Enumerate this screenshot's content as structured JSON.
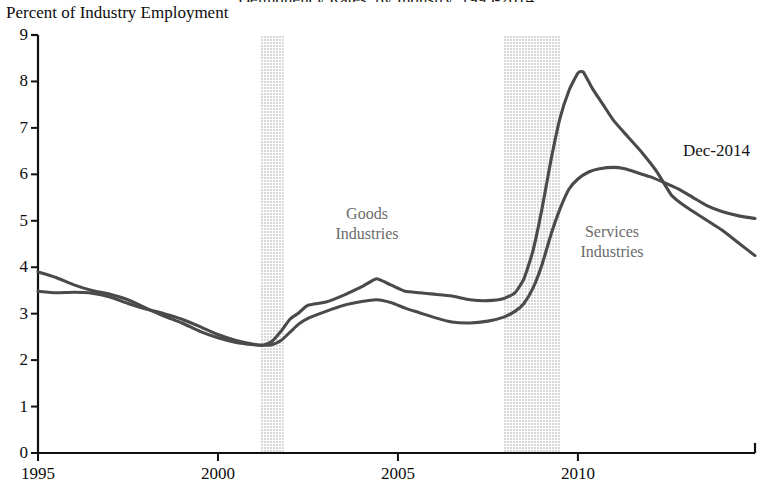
{
  "header": {
    "cut_off_title": "Delinquency Rates, by Industry, 1995-2014",
    "y_axis_caption": "Percent of Industry Employment"
  },
  "annotations": {
    "goods_label_line1": "Goods",
    "goods_label_line2": "Industries",
    "services_label_line1": "Services",
    "services_label_line2": "Industries",
    "end_point_label": "Dec-2014"
  },
  "colors": {
    "line": "#4a4a4a",
    "recession_band": "#d7d7d7",
    "axis": "#111111",
    "series_label": "#6b6b6b",
    "tick_text": "#0d0d0d"
  },
  "chart_data": {
    "type": "line",
    "title": "Delinquency Rates, by Industry, 1995-2014",
    "xlabel": "",
    "ylabel": "Percent of Industry Employment",
    "xlim": [
      1995,
      2014.92
    ],
    "ylim": [
      0,
      9
    ],
    "xticks": [
      1995,
      2000,
      2005,
      2010
    ],
    "xtick_labels": [
      "1995",
      "2000",
      "2005",
      "2010"
    ],
    "yticks": [
      0,
      1,
      2,
      3,
      4,
      5,
      6,
      7,
      8,
      9
    ],
    "ytick_labels": [
      "0",
      "1",
      "2",
      "3",
      "4",
      "5",
      "6",
      "7",
      "8",
      "9"
    ],
    "grid": false,
    "legend_position": "inline-annotations",
    "shaded_regions": [
      {
        "name": "recession-2001",
        "x_start": 2001.17,
        "x_end": 2001.83,
        "color": "#d7d7d7"
      },
      {
        "name": "recession-2008",
        "x_start": 2007.92,
        "x_end": 2009.5,
        "color": "#d7d7d7"
      }
    ],
    "series": [
      {
        "name": "Goods Industries",
        "color": "#4a4a4a",
        "x": [
          1995.0,
          1995.5,
          1996.0,
          1996.5,
          1997.0,
          1997.5,
          1998.0,
          1998.5,
          1999.0,
          1999.5,
          2000.0,
          2000.5,
          2001.0,
          2001.25,
          2001.5,
          2001.75,
          2002.0,
          2002.25,
          2002.5,
          2003.0,
          2003.5,
          2004.0,
          2004.4,
          2004.8,
          2005.2,
          2005.6,
          2006.0,
          2006.5,
          2007.0,
          2007.5,
          2007.92,
          2008.25,
          2008.5,
          2008.75,
          2009.0,
          2009.25,
          2009.5,
          2009.75,
          2010.0,
          2010.15,
          2010.4,
          2010.7,
          2011.0,
          2011.4,
          2011.8,
          2012.2,
          2012.6,
          2013.0,
          2013.5,
          2014.0,
          2014.5,
          2014.92
        ],
        "y": [
          3.9,
          3.78,
          3.62,
          3.5,
          3.42,
          3.3,
          3.12,
          2.95,
          2.8,
          2.62,
          2.48,
          2.38,
          2.33,
          2.32,
          2.4,
          2.62,
          2.88,
          3.02,
          3.18,
          3.25,
          3.4,
          3.58,
          3.75,
          3.62,
          3.48,
          3.45,
          3.42,
          3.38,
          3.3,
          3.28,
          3.32,
          3.45,
          3.75,
          4.35,
          5.25,
          6.3,
          7.2,
          7.8,
          8.18,
          8.2,
          7.85,
          7.5,
          7.15,
          6.8,
          6.45,
          6.05,
          5.55,
          5.3,
          5.05,
          4.8,
          4.5,
          4.25
        ]
      },
      {
        "name": "Services Industries",
        "color": "#4a4a4a",
        "x": [
          1995.0,
          1995.5,
          1996.0,
          1996.5,
          1997.0,
          1997.5,
          1998.0,
          1998.5,
          1999.0,
          1999.5,
          2000.0,
          2000.5,
          2001.0,
          2001.25,
          2001.5,
          2001.75,
          2002.0,
          2002.25,
          2002.5,
          2003.0,
          2003.5,
          2004.0,
          2004.4,
          2004.8,
          2005.2,
          2005.6,
          2006.0,
          2006.5,
          2007.0,
          2007.5,
          2007.92,
          2008.25,
          2008.5,
          2008.75,
          2009.0,
          2009.25,
          2009.5,
          2009.75,
          2010.0,
          2010.3,
          2010.6,
          2011.0,
          2011.3,
          2011.6,
          2012.0,
          2012.4,
          2012.8,
          2013.2,
          2013.6,
          2014.0,
          2014.5,
          2014.92
        ],
        "y": [
          3.48,
          3.45,
          3.46,
          3.44,
          3.36,
          3.22,
          3.1,
          3.0,
          2.88,
          2.72,
          2.55,
          2.42,
          2.34,
          2.32,
          2.33,
          2.42,
          2.6,
          2.78,
          2.9,
          3.05,
          3.18,
          3.26,
          3.3,
          3.24,
          3.12,
          3.02,
          2.92,
          2.82,
          2.8,
          2.84,
          2.92,
          3.05,
          3.22,
          3.55,
          4.05,
          4.7,
          5.25,
          5.68,
          5.9,
          6.05,
          6.12,
          6.15,
          6.12,
          6.05,
          5.95,
          5.82,
          5.68,
          5.5,
          5.32,
          5.2,
          5.1,
          5.05
        ]
      }
    ],
    "point_annotations": [
      {
        "label": "Dec-2014",
        "x": 2014.92,
        "note": "end of series"
      }
    ]
  }
}
